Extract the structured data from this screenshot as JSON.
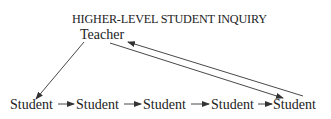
{
  "diagram": {
    "title": "HIGHER-LEVEL STUDENT INQUIRY",
    "teacher_label": "Teacher",
    "students": [
      "Student",
      "Student",
      "Student",
      "Student",
      "Student"
    ],
    "edges": [
      {
        "from": "Teacher",
        "to": "Student 1"
      },
      {
        "from": "Student 1",
        "to": "Student 2"
      },
      {
        "from": "Student 2",
        "to": "Student 3"
      },
      {
        "from": "Student 3",
        "to": "Student 4"
      },
      {
        "from": "Student 4",
        "to": "Student 5"
      },
      {
        "from": "Teacher",
        "to": "Student 5"
      },
      {
        "from": "Student 5",
        "to": "Teacher"
      }
    ],
    "line_color": "#333333"
  }
}
